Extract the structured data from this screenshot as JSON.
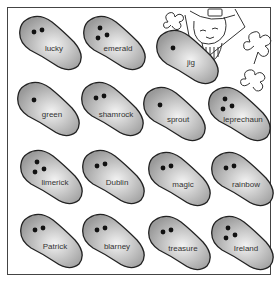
{
  "worksheet": {
    "colors": {
      "bean_fill_light": "#f2f2f2",
      "bean_fill_dark": "#9a9a9a",
      "outline": "#222222",
      "border": "#444444"
    },
    "beans": [
      {
        "word": "lucky",
        "dots": 2,
        "x": 18,
        "y": 14,
        "rot": 0
      },
      {
        "word": "emerald",
        "dots": 3,
        "x": 82,
        "y": 14,
        "rot": 0
      },
      {
        "word": "jig",
        "dots": 1,
        "x": 155,
        "y": 28,
        "rot": 0
      },
      {
        "word": "green",
        "dots": 1,
        "x": 16,
        "y": 80,
        "rot": 0
      },
      {
        "word": "shamrock",
        "dots": 2,
        "x": 80,
        "y": 80,
        "rot": 0
      },
      {
        "word": "sprout",
        "dots": 1,
        "x": 142,
        "y": 85,
        "rot": 0
      },
      {
        "word": "leprechaun",
        "dots": 3,
        "x": 207,
        "y": 85,
        "rot": 0
      },
      {
        "word": "limerick",
        "dots": 3,
        "x": 19,
        "y": 148,
        "rot": 0
      },
      {
        "word": "Dublin",
        "dots": 2,
        "x": 81,
        "y": 148,
        "rot": 0
      },
      {
        "word": "magic",
        "dots": 2,
        "x": 147,
        "y": 150,
        "rot": 0
      },
      {
        "word": "rainbow",
        "dots": 2,
        "x": 210,
        "y": 150,
        "rot": 0
      },
      {
        "word": "Patrick",
        "dots": 2,
        "x": 19,
        "y": 212,
        "rot": 0
      },
      {
        "word": "blarney",
        "dots": 2,
        "x": 81,
        "y": 212,
        "rot": 0
      },
      {
        "word": "treasure",
        "dots": 2,
        "x": 147,
        "y": 214,
        "rot": 0
      },
      {
        "word": "Ireland",
        "dots": 3,
        "x": 210,
        "y": 214,
        "rot": 0
      }
    ],
    "illustration": {
      "subject": "leprechaun-with-shamrocks"
    }
  }
}
